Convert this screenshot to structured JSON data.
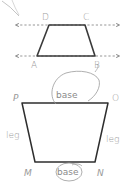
{
  "figure": {
    "width": 131,
    "height": 184,
    "colors": {
      "shape_stroke": "#3a3a3a",
      "dashed_line": "#8a8a8a",
      "label": "#9a9a9a",
      "circle": "#9a9a9a",
      "background": "#ffffff"
    },
    "top_trapezoid": {
      "vertices": {
        "D": "D",
        "C": "C",
        "A": "A",
        "B": "B"
      },
      "parallel_lines": 2
    },
    "bottom_trapezoid": {
      "vertices": {
        "P": "P",
        "O": "O",
        "M": "M",
        "N": "N"
      },
      "labels": {
        "base_top": "base",
        "base_bottom": "base",
        "leg_left": "leg",
        "leg_right": "leg"
      }
    }
  }
}
